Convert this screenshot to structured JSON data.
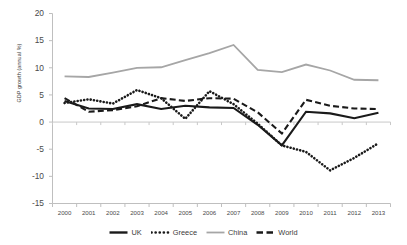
{
  "chart_data": {
    "type": "line",
    "title": "",
    "xlabel": "",
    "ylabel": "GDP growth (annual %)",
    "categories": [
      "2000",
      "2001",
      "2002",
      "2003",
      "2004",
      "2005",
      "2006",
      "2007",
      "2008",
      "2009",
      "2010",
      "2011",
      "2012",
      "2013"
    ],
    "x": [
      2000,
      2001,
      2002,
      2003,
      2004,
      2005,
      2006,
      2007,
      2008,
      2009,
      2010,
      2011,
      2012,
      2013
    ],
    "ylim": [
      -15,
      20
    ],
    "yticks": [
      20,
      15,
      10,
      5,
      0,
      -5,
      -10,
      -15
    ],
    "grid": false,
    "legend_position": "bottom",
    "series": [
      {
        "name": "UK",
        "style": "solid",
        "color": "#1a1a1a",
        "values": [
          3.9,
          2.5,
          2.4,
          3.3,
          2.4,
          3.0,
          2.7,
          2.6,
          -0.5,
          -4.3,
          1.9,
          1.6,
          0.7,
          1.7
        ]
      },
      {
        "name": "Greece",
        "style": "dotted",
        "color": "#1a1a1a",
        "values": [
          3.5,
          4.2,
          3.4,
          5.9,
          4.4,
          0.6,
          5.7,
          3.3,
          -0.3,
          -4.3,
          -5.5,
          -8.9,
          -6.6,
          -3.9
        ]
      },
      {
        "name": "China",
        "style": "solid",
        "color": "#a6a6a6",
        "values": [
          8.4,
          8.3,
          9.1,
          10.0,
          10.1,
          11.4,
          12.7,
          14.2,
          9.6,
          9.2,
          10.6,
          9.5,
          7.8,
          7.7
        ]
      },
      {
        "name": "World",
        "style": "dashed",
        "color": "#1a1a1a",
        "values": [
          4.4,
          1.9,
          2.2,
          2.9,
          4.4,
          3.9,
          4.4,
          4.3,
          1.8,
          -2.1,
          4.1,
          3.0,
          2.5,
          2.4
        ]
      }
    ]
  },
  "legend": {
    "items": [
      {
        "label": "UK",
        "swatch": "line-solid-black"
      },
      {
        "label": "Greece",
        "swatch": "line-dotted-black"
      },
      {
        "label": "China",
        "swatch": "line-solid-gray"
      },
      {
        "label": "World",
        "swatch": "line-dashed-black"
      }
    ]
  },
  "axis": {
    "y_label": "GDP growth (annual %)",
    "y_ticks": [
      "20",
      "15",
      "10",
      "5",
      "0",
      "-5",
      "-10",
      "-15"
    ],
    "x_ticks": [
      "2000",
      "2001",
      "2002",
      "2003",
      "2004",
      "2005",
      "2006",
      "2007",
      "2008",
      "2009",
      "2010",
      "2011",
      "2012",
      "2013"
    ]
  }
}
